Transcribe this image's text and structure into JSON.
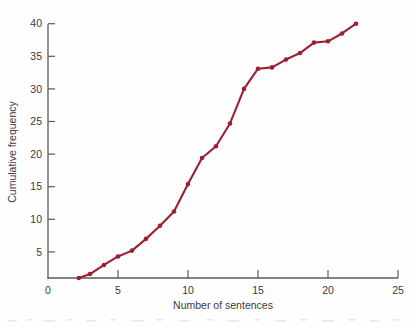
{
  "chart_data": {
    "type": "line",
    "title": "",
    "xlabel": "Number of sentences",
    "ylabel": "Cumulative frequency",
    "xlim": [
      0,
      25
    ],
    "ylim": [
      0,
      41
    ],
    "xticks": [
      0,
      5,
      10,
      15,
      20,
      25
    ],
    "yticks": [
      5,
      10,
      15,
      20,
      25,
      30,
      35,
      40
    ],
    "grid": false,
    "legend": null,
    "marker": "filled-circle",
    "line_color": "#9B2033",
    "marker_color": "#9B2033",
    "x": [
      2.2,
      3.0,
      4.0,
      5.0,
      6.0,
      7.0,
      8.0,
      9.0,
      10.0,
      11.0,
      12.0,
      13.0,
      14.0,
      15.0,
      16.0,
      17.0,
      18.0,
      19.0,
      20.0,
      21.0,
      22.0
    ],
    "y": [
      1,
      1.6,
      3,
      4.3,
      5.2,
      7,
      9,
      11.2,
      15.4,
      19.4,
      21.2,
      24.7,
      30,
      33.1,
      33.3,
      34.5,
      35.5,
      37.1,
      37.3,
      38.5,
      40
    ],
    "series": [
      {
        "name": "Cumulative frequency",
        "values": [
          1,
          1.6,
          3,
          4.3,
          5.2,
          7,
          9,
          11.2,
          15.4,
          19.4,
          21.2,
          24.7,
          30,
          33.1,
          33.3,
          34.5,
          35.5,
          37.1,
          37.3,
          38.5,
          40
        ]
      }
    ]
  },
  "axes": {
    "x_tick_labels": [
      "0",
      "5",
      "10",
      "15",
      "20",
      "25"
    ],
    "y_tick_labels": [
      "5",
      "10",
      "15",
      "20",
      "25",
      "30",
      "35",
      "40"
    ],
    "x_axis_title": "Number of sentences",
    "y_axis_title": "Cumulative frequency"
  }
}
